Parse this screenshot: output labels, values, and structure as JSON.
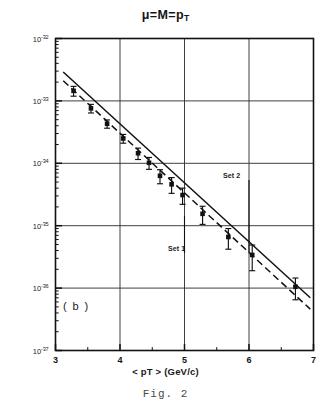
{
  "figure": {
    "title_mu": "μ",
    "title_eq1": "=",
    "title_M": "M",
    "title_eq2": "=",
    "title_p": "p",
    "title_sub": "T",
    "title_plain": "μ = M = pT",
    "caption": "Fig. 2",
    "panel_label": "( b )"
  },
  "annotations": [
    {
      "name": "set-2",
      "label": "Set 2",
      "x": 6.0,
      "label_x_px": 223,
      "label_y_px": 172,
      "line_top_px": 180,
      "line_bottom_px": 253
    },
    {
      "name": "set-1",
      "label": "Set 1",
      "x": 5.0,
      "label_x_px": 168,
      "label_y_px": 245,
      "line_top_px": 216,
      "line_bottom_px": 253
    }
  ],
  "chart_data": {
    "type": "scatter",
    "xlabel": "< pT >  (GeV/c)",
    "ylabel": "",
    "xlim": [
      3,
      7
    ],
    "ylim": [
      1e-37,
      1e-32
    ],
    "yscale": "log",
    "xscale": "linear",
    "grid": true,
    "legend": false,
    "xticks": [
      3,
      4,
      5,
      6,
      7
    ],
    "xtick_labels": [
      "3",
      "4",
      "5",
      "6",
      "7"
    ],
    "yticks": [
      1e-32,
      1e-33,
      1e-34,
      1e-35,
      1e-36,
      1e-37
    ],
    "ytick_labels": [
      "10-32",
      "10-33",
      "10-34",
      "10-35",
      "10-36",
      "10-37"
    ],
    "ytick_mantissa": "10",
    "ytick_exponents": [
      "-32",
      "-33",
      "-34",
      "-35",
      "-36",
      "-37"
    ],
    "points": [
      {
        "x": 3.28,
        "y": 1.45e-33,
        "yerr_lo": 2.6e-34,
        "yerr_hi": 2.6e-34
      },
      {
        "x": 3.55,
        "y": 7.6e-34,
        "yerr_lo": 1.2e-34,
        "yerr_hi": 1.2e-34
      },
      {
        "x": 3.8,
        "y": 4.3e-34,
        "yerr_lo": 6.5e-35,
        "yerr_hi": 6.5e-35
      },
      {
        "x": 4.05,
        "y": 2.5e-34,
        "yerr_lo": 4e-35,
        "yerr_hi": 4e-35
      },
      {
        "x": 4.28,
        "y": 1.45e-34,
        "yerr_lo": 3e-35,
        "yerr_hi": 3e-35
      },
      {
        "x": 4.45,
        "y": 1.02e-34,
        "yerr_lo": 2.2e-35,
        "yerr_hi": 2.2e-35
      },
      {
        "x": 4.62,
        "y": 6.3e-35,
        "yerr_lo": 1.6e-35,
        "yerr_hi": 1.6e-35
      },
      {
        "x": 4.8,
        "y": 4.6e-35,
        "yerr_lo": 1.3e-35,
        "yerr_hi": 1.3e-35
      },
      {
        "x": 4.97,
        "y": 3.1e-35,
        "yerr_lo": 9e-36,
        "yerr_hi": 9e-36
      },
      {
        "x": 5.28,
        "y": 1.55e-35,
        "yerr_lo": 5e-36,
        "yerr_hi": 5e-36
      },
      {
        "x": 5.68,
        "y": 6.6e-36,
        "yerr_lo": 2.4e-36,
        "yerr_hi": 2.4e-36
      },
      {
        "x": 6.05,
        "y": 3.4e-36,
        "yerr_lo": 1.5e-36,
        "yerr_hi": 1.5e-36
      },
      {
        "x": 6.72,
        "y": 1.05e-36,
        "yerr_lo": 4e-37,
        "yerr_hi": 4e-37
      }
    ],
    "series": [
      {
        "name": "solid-fit-line",
        "style": "solid",
        "x": [
          3.12,
          6.95
        ],
        "y": [
          2.9e-33,
          7e-37
        ]
      },
      {
        "name": "dashed-fit-line",
        "style": "dashed",
        "x": [
          3.12,
          6.95
        ],
        "y": [
          2.1e-33,
          4.6e-37
        ]
      }
    ]
  }
}
